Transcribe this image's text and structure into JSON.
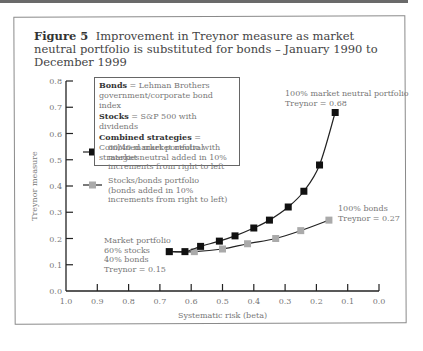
{
  "figure": {
    "label": "Figure 5",
    "title": "Improvement in Treynor measure as market neutral portfolio is substituted for bonds – January 1990 to December 1999"
  },
  "notes": [
    {
      "key": "Bonds",
      "text": " = Lehman Brothers government/corporate bond index"
    },
    {
      "key": "Stocks",
      "text": " = S&P 500 with dividends"
    },
    {
      "key": "Combined strategies",
      "text": " = Combined market neutral strategies"
    }
  ],
  "legend": [
    {
      "name": "60/40 market portfolio with market neutral added in 10% increments from right to left",
      "color": "#111111"
    },
    {
      "name": "Stocks/bonds portfolio (bonds added in 10% increments from right to left)",
      "color": "#aaaaaa"
    }
  ],
  "annotations": {
    "mn100": [
      "100% market neutral portfolio",
      "Treynor = 0.68"
    ],
    "bonds100": [
      "100% bonds",
      "Treynor = 0.27"
    ],
    "market": [
      "Market portfolio",
      "60% stocks",
      "40% bonds",
      "Treynor = 0.15"
    ]
  },
  "chart_data": {
    "type": "line",
    "title": "Improvement in Treynor measure as market neutral portfolio is substituted for bonds – January 1990 to December 1999",
    "xlabel": "Systematic risk (beta)",
    "ylabel": "Treynor measure",
    "xlim": [
      1.0,
      0.0
    ],
    "ylim": [
      0.0,
      0.8
    ],
    "x_reversed": true,
    "xticks": [
      "1.0",
      "0.9",
      "0.8",
      "0.7",
      "0.6",
      "0.5",
      "0.4",
      "0.3",
      "0.2",
      "0.1",
      "0.0"
    ],
    "yticks": [
      "0.0",
      "0.1",
      "0.2",
      "0.3",
      "0.4",
      "0.5",
      "0.6",
      "0.7",
      "0.8"
    ],
    "grid": false,
    "series": [
      {
        "name": "60/40 market portfolio with market neutral added in 10% increments from right to left",
        "marker": "black-square",
        "x": [
          0.67,
          0.62,
          0.57,
          0.51,
          0.46,
          0.4,
          0.35,
          0.29,
          0.24,
          0.19,
          0.14
        ],
        "y": [
          0.15,
          0.15,
          0.17,
          0.19,
          0.21,
          0.24,
          0.27,
          0.32,
          0.38,
          0.48,
          0.68
        ]
      },
      {
        "name": "Stocks/bonds portfolio (bonds added in 10% increments from right to left)",
        "marker": "gray-square",
        "x": [
          0.67,
          0.59,
          0.5,
          0.42,
          0.33,
          0.25,
          0.16
        ],
        "y": [
          0.15,
          0.15,
          0.16,
          0.18,
          0.2,
          0.23,
          0.27
        ]
      }
    ]
  }
}
